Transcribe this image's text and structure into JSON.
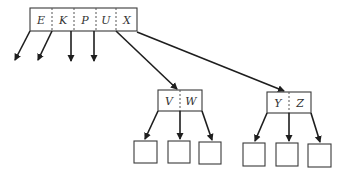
{
  "diagram": {
    "type": "b-tree",
    "root": {
      "keys": [
        "E",
        "K",
        "P",
        "U",
        "X"
      ]
    },
    "children": [
      {
        "keys": [
          "V",
          "W"
        ],
        "leaf_count": 3
      },
      {
        "keys": [
          "Y",
          "Z"
        ],
        "leaf_count": 3
      }
    ],
    "dangling_root_pointers": 4,
    "colors": {
      "stroke": "#3a3a3a",
      "arrow": "#1e1e1e",
      "text": "#333333",
      "background": "#ffffff"
    }
  }
}
